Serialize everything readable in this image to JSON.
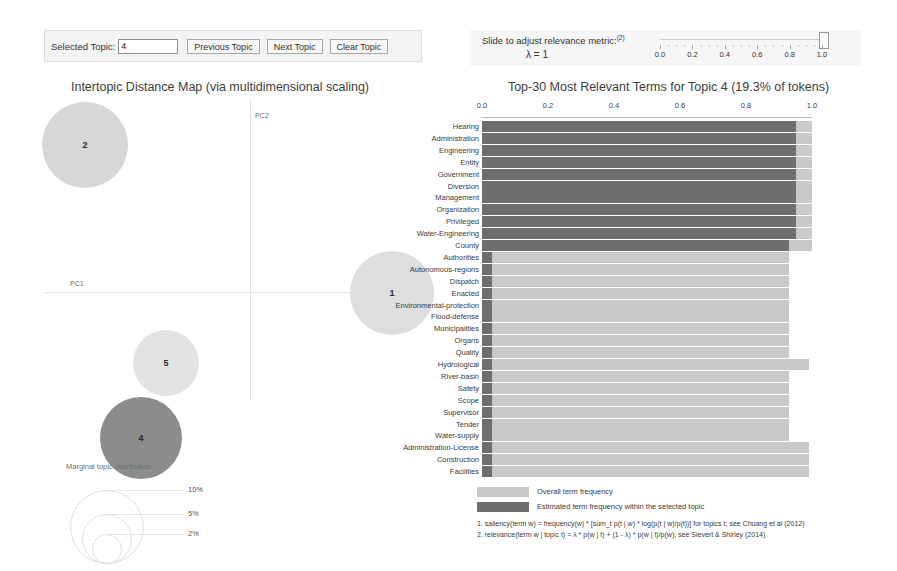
{
  "toolbar": {
    "selected_topic_label": "Selected Topic:",
    "topic_value": "4",
    "previous_button": "Previous Topic",
    "next_button": "Next Topic",
    "clear_button": "Clear Topic"
  },
  "slider": {
    "caption": "Slide to adjust relevance metric:",
    "caption_sup": "(2)",
    "lambda_label": "λ = 1",
    "lambda_value": 1.0,
    "ticks": [
      0.0,
      0.2,
      0.4,
      0.6,
      0.8,
      1.0
    ],
    "tick_labels": [
      "0.0",
      "0.2",
      "0.4",
      "0.6",
      "0.8",
      "1.0"
    ]
  },
  "left_panel": {
    "title": "Intertopic Distance Map (via multidimensional scaling)",
    "x_axis_label": "PC1",
    "y_axis_label": "PC2",
    "topics": [
      {
        "id": "2",
        "cx": 85,
        "cy": 145,
        "r": 43,
        "color": "#d7d7d7",
        "selected": false
      },
      {
        "id": "5",
        "cx": 166,
        "cy": 363,
        "r": 33,
        "color": "#e3e3e3",
        "selected": false
      },
      {
        "id": "1",
        "cx": 392,
        "cy": 293,
        "r": 42,
        "color": "#dedede",
        "selected": false
      },
      {
        "id": "4",
        "cx": 141,
        "cy": 438,
        "r": 41,
        "color": "#8c8c8c",
        "selected": true
      }
    ],
    "size_legend": {
      "title": "Marginal topic distribution",
      "items": [
        {
          "label": "2%",
          "r": 14
        },
        {
          "label": "5%",
          "r": 24
        },
        {
          "label": "10%",
          "r": 36
        }
      ]
    }
  },
  "chart_data": {
    "type": "bar",
    "orientation": "horizontal",
    "title": "Top-30 Most Relevant Terms for Topic 4 (19.3% of tokens)",
    "topic_id": 4,
    "topic_token_share": "19.3%",
    "xlabel": "",
    "ylabel": "",
    "xlim": [
      0.0,
      1.0
    ],
    "xticks": [
      0.0,
      0.2,
      0.4,
      0.6,
      0.8,
      1.0
    ],
    "xtick_labels": [
      "0.0",
      "0.2",
      "0.4",
      "0.6",
      "0.8",
      "1.0"
    ],
    "grid": false,
    "legend_position": "bottom",
    "categories": [
      "Hearing",
      "Administration",
      "Engineering",
      "Entity",
      "Government",
      "Diversion",
      "Management",
      "Organization",
      "Privileged",
      "Water-Engineering",
      "County",
      "Authorities",
      "Autonomous-regions",
      "Dispatch",
      "Enacted",
      "Environmental-protection",
      "Flood-defense",
      "Municipalities",
      "Organs",
      "Quality",
      "Hydrological",
      "River-basin",
      "Safety",
      "Scope",
      "Supervisor",
      "Tender",
      "Water-supply",
      "Administration-License",
      "Construction",
      "Facilities"
    ],
    "series": [
      {
        "name": "Overall term frequency",
        "color": "#c9c9c9",
        "values": [
          1.0,
          1.0,
          1.0,
          1.0,
          1.0,
          1.0,
          1.0,
          1.0,
          1.0,
          1.0,
          1.0,
          0.93,
          0.93,
          0.93,
          0.93,
          0.93,
          0.93,
          0.93,
          0.93,
          0.93,
          0.99,
          0.93,
          0.93,
          0.93,
          0.93,
          0.93,
          0.93,
          0.99,
          0.99,
          0.99
        ]
      },
      {
        "name": "Estimated term frequency within the selected topic",
        "color": "#6e6e6e",
        "values": [
          0.95,
          0.95,
          0.95,
          0.95,
          0.95,
          0.95,
          0.95,
          0.95,
          0.95,
          0.95,
          0.93,
          0.03,
          0.03,
          0.03,
          0.03,
          0.03,
          0.03,
          0.03,
          0.03,
          0.03,
          0.03,
          0.03,
          0.03,
          0.03,
          0.03,
          0.03,
          0.03,
          0.03,
          0.03,
          0.03
        ]
      }
    ]
  },
  "legend": {
    "overall_label": "Overall term frequency",
    "topic_label": "Estimated term frequency within the selected topic",
    "overall_color": "#c9c9c9",
    "topic_color": "#6e6e6e"
  },
  "footnotes": {
    "note1": "1. saliency(term w) = frequency(w) * [sum_t p(t | w) * log(p(t | w)/p(t))] for topics t; see Chuang et al (2012)",
    "note2": "2. relevance(term w | topic t) = λ * p(w | t) + (1 - λ) * p(w | t)/p(w); see Sievert & Shirley (2014)"
  }
}
